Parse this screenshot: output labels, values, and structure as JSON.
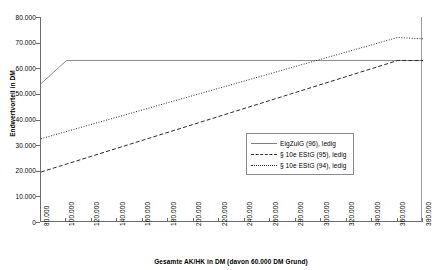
{
  "chart_data": {
    "type": "line",
    "title": "",
    "xlabel": "Gesamte AK/HK in DM (davon 60.000 DM Grund)",
    "ylabel": "Endwertvorteil in DM",
    "xlim": [
      80000,
      380000
    ],
    "ylim": [
      0,
      80000
    ],
    "grid": false,
    "legend_position": "inside-right",
    "x_tick_labels": [
      "80.000",
      "100.000",
      "120.000",
      "140.000",
      "160.000",
      "180.000",
      "200.000",
      "220.000",
      "240.000",
      "260.000",
      "280.000",
      "300.000",
      "320.000",
      "340.000",
      "360.000",
      "380.000"
    ],
    "x_tick_values": [
      80000,
      100000,
      120000,
      140000,
      160000,
      180000,
      200000,
      220000,
      240000,
      260000,
      280000,
      300000,
      320000,
      340000,
      360000,
      380000
    ],
    "y_tick_labels": [
      "0",
      "10.000",
      "20.000",
      "30.000",
      "40.000",
      "50.000",
      "60.000",
      "70.000",
      "80.000"
    ],
    "y_tick_values": [
      0,
      10000,
      20000,
      30000,
      40000,
      50000,
      60000,
      70000,
      80000
    ],
    "series": [
      {
        "name": "EigZulG (96), ledig",
        "style": "solid",
        "color": "#7d7d7d",
        "x": [
          80000,
          100000,
          380000
        ],
        "values": [
          54000,
          63000,
          63000
        ]
      },
      {
        "name": "§ 10e EStG (95), ledig",
        "style": "dashed",
        "color": "#2b2b2b",
        "x": [
          80000,
          360000,
          380000
        ],
        "values": [
          19500,
          63000,
          63000
        ]
      },
      {
        "name": "§ 10e EStG (94), ledig",
        "style": "dotted",
        "color": "#2b2b2b",
        "x": [
          80000,
          360000,
          380000
        ],
        "values": [
          32500,
          72000,
          71500
        ]
      }
    ]
  },
  "legend": {
    "items": [
      {
        "label": "EigZulG (96), ledig"
      },
      {
        "label": "§ 10e EStG (95), ledig"
      },
      {
        "label": "§ 10e EStG (94), ledig"
      }
    ]
  }
}
